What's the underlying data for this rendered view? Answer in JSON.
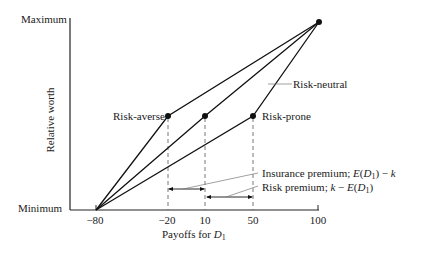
{
  "diagram": {
    "y_axis": {
      "label": "Relative worth",
      "top_label": "Maximum",
      "bottom_label": "Minimum"
    },
    "x_axis": {
      "label_prefix": "Payoffs for ",
      "label_var": "D",
      "label_sub": "1",
      "ticks": [
        "−80",
        "−20",
        "10",
        "50",
        "100"
      ]
    },
    "curves": [
      {
        "name": "Risk-averse",
        "via_payoff": -20
      },
      {
        "name": "Risk-neutral",
        "via_payoff": 10
      },
      {
        "name": "Risk-prone",
        "via_payoff": 50
      }
    ],
    "labels": {
      "risk_averse": "Risk-averse",
      "risk_neutral": "Risk-neutral",
      "risk_prone": "Risk-prone"
    },
    "annotations": {
      "insurance_premium_text": "Insurance premium; ",
      "insurance_premium_formula_a": "E",
      "insurance_premium_formula_b": "(",
      "insurance_premium_formula_c": "D",
      "insurance_premium_formula_sub": "1",
      "insurance_premium_formula_d": ") − ",
      "insurance_premium_formula_e": "k",
      "risk_premium_text": "Risk premium; ",
      "risk_premium_formula_a": "k",
      "risk_premium_formula_b": " − ",
      "risk_premium_formula_c": "E",
      "risk_premium_formula_d": "(",
      "risk_premium_formula_e": "D",
      "risk_premium_formula_sub": "1",
      "risk_premium_formula_f": ")"
    }
  }
}
